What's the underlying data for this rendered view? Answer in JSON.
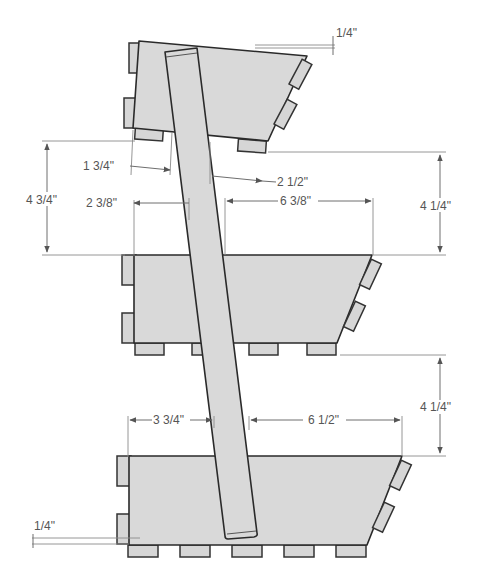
{
  "drawing": {
    "title": "Tiered planter side elevation",
    "colors": {
      "wood_fill": "#d9d9d9",
      "outline": "#2a2a2a",
      "dimension": "#555555",
      "background": "#ffffff"
    },
    "dimensions": {
      "top_tilt": "1/4\"",
      "top_overhang": "1 3/4\"",
      "top_leg_offset": "2 1/2\"",
      "top_to_middle_height": "4 3/4\"",
      "middle_left_span": "2 3/8\"",
      "middle_right_span": "6 3/8\"",
      "middle_rise_right": "4 1/4\"",
      "bottom_rise_right": "4 1/4\"",
      "bottom_left_span": "3 3/4\"",
      "bottom_right_span": "6 1/2\"",
      "bottom_gap": "1/4\""
    },
    "parts": {
      "tiers": [
        "top-tier",
        "middle-tier",
        "bottom-tier"
      ],
      "leg": "diagonal-leg",
      "feet_per_tier": [
        3,
        4,
        5
      ]
    }
  }
}
